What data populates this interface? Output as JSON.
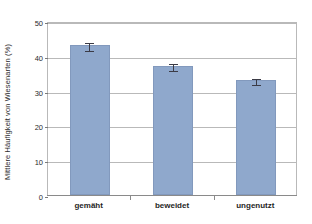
{
  "chart_data": {
    "type": "bar",
    "title": "",
    "xlabel": "",
    "ylabel": "Mittlere Häufigkeit von Wiesenarten (%)",
    "categories": [
      "gemäht",
      "beweidet",
      "ungenutzt"
    ],
    "values": [
      43,
      37,
      33
    ],
    "errors": [
      1.3,
      1.2,
      1.0
    ],
    "ylim": [
      0,
      50
    ],
    "yticks": [
      0,
      10,
      20,
      30,
      40,
      50
    ],
    "ytick_labels": [
      "0",
      "10",
      "20",
      "30",
      "40",
      "50"
    ],
    "grid": true,
    "legend": null,
    "bar_color": "#8fa8cc",
    "error_color": "#3b3b46",
    "axis_color": "#8a8a8a",
    "grid_color": "#b9b9b9"
  }
}
